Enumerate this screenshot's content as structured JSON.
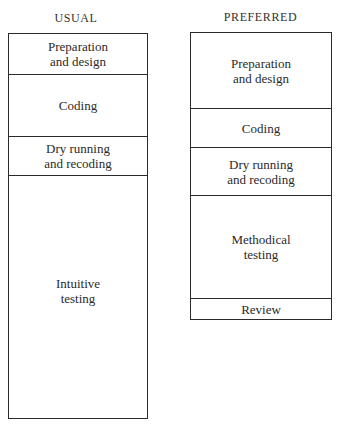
{
  "figure": {
    "cut_header": "PREFERRED METHOD"
  },
  "usual": {
    "title": "USUAL",
    "segments": [
      {
        "label": "Preparation\nand design",
        "height": 41
      },
      {
        "label": "Coding",
        "height": 62
      },
      {
        "label": "Dry running\nand recoding",
        "height": 39
      },
      {
        "label": "Intuitive\ntesting",
        "height": 243
      }
    ]
  },
  "preferred": {
    "title": "PREFERRED",
    "segments": [
      {
        "label": "Preparation\nand design",
        "height": 76
      },
      {
        "label": "Coding",
        "height": 39
      },
      {
        "label": "Dry running\nand recoding",
        "height": 48
      },
      {
        "label": "Methodical\ntesting",
        "height": 103
      },
      {
        "label": "Review",
        "height": 21
      }
    ]
  }
}
